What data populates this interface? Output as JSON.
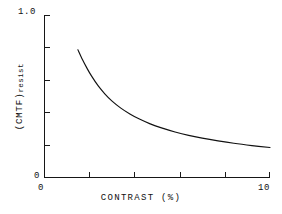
{
  "chart_data": {
    "type": "line",
    "title": "",
    "subtitle": "",
    "xlabel": "CONTRAST (%)",
    "ylabel": "(CMTF)resist",
    "ylabel_base": "(CMTF)",
    "ylabel_subscript": "resist",
    "xlim": [
      0,
      10
    ],
    "ylim": [
      0,
      1.0
    ],
    "grid": false,
    "legend": null,
    "x_tick_labels": [
      "0",
      "10"
    ],
    "y_tick_labels": [
      "0",
      "1.0"
    ],
    "x_ticks_positions": [
      0,
      2,
      4,
      6,
      8,
      10
    ],
    "y_ticks_positions": [
      0,
      0.2,
      0.4,
      0.6,
      0.8,
      1.0
    ],
    "line_color": "#111111",
    "axis_color": "#161616",
    "background_color": "#ffffff",
    "series": [
      {
        "name": "CMTF resist vs contrast",
        "x": [
          1.5,
          1.7,
          1.9,
          2.1,
          2.4,
          2.7,
          3.0,
          3.4,
          3.8,
          4.2,
          4.7,
          5.2,
          5.8,
          6.4,
          7.0,
          7.7,
          8.4,
          9.2,
          10.0
        ],
        "y": [
          0.785,
          0.725,
          0.672,
          0.624,
          0.562,
          0.512,
          0.47,
          0.425,
          0.389,
          0.359,
          0.328,
          0.303,
          0.278,
          0.257,
          0.24,
          0.223,
          0.208,
          0.194,
          0.182
        ]
      }
    ]
  },
  "plot_geometry": {
    "left_px": 44,
    "right_px": 270,
    "top_px": 15,
    "bottom_px": 177,
    "tick_length_px": 5
  }
}
